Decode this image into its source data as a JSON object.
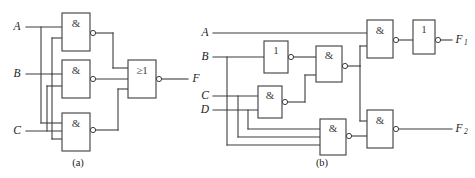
{
  "figure": {
    "background_color": "#ffffff",
    "line_color": "#3d3d40",
    "text_color": "#1b1b1d",
    "panels": [
      {
        "id": "a",
        "caption": "(a)",
        "inputs": [
          {
            "name": "input-a",
            "label": "A"
          },
          {
            "name": "input-b",
            "label": "B"
          },
          {
            "name": "input-c",
            "label": "C"
          }
        ],
        "outputs": [
          {
            "name": "output-f",
            "label": "F"
          }
        ],
        "gates": [
          {
            "name": "nand-gate-1",
            "label": "&",
            "inverted": true
          },
          {
            "name": "nand-gate-2",
            "label": "&",
            "inverted": true
          },
          {
            "name": "nand-gate-3",
            "label": "&",
            "inverted": true
          },
          {
            "name": "nor-gate-1",
            "label": "≥1",
            "inverted": true
          }
        ]
      },
      {
        "id": "b",
        "caption": "(b)",
        "inputs": [
          {
            "name": "input-a",
            "label": "A"
          },
          {
            "name": "input-b",
            "label": "B"
          },
          {
            "name": "input-c",
            "label": "C"
          },
          {
            "name": "input-d",
            "label": "D"
          }
        ],
        "outputs": [
          {
            "name": "output-f1",
            "label": "F",
            "subscript": "1"
          },
          {
            "name": "output-f2",
            "label": "F",
            "subscript": "2"
          }
        ],
        "gates": [
          {
            "name": "not-gate-1",
            "label": "1",
            "inverted": true
          },
          {
            "name": "nand-gate-1",
            "label": "&",
            "inverted": true
          },
          {
            "name": "nand-gate-2",
            "label": "&",
            "inverted": true
          },
          {
            "name": "nand-gate-3",
            "label": "&",
            "inverted": true
          },
          {
            "name": "nand-gate-4",
            "label": "&",
            "inverted": true
          },
          {
            "name": "nand-gate-5",
            "label": "&",
            "inverted": true
          },
          {
            "name": "not-gate-2",
            "label": "1",
            "inverted": true
          }
        ]
      }
    ]
  }
}
